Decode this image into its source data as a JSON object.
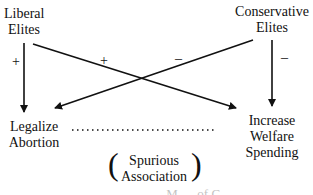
{
  "nodes": {
    "liberal_elites": [
      "Liberal",
      "Elites"
    ],
    "conservative_elites": [
      "Conservative",
      "Elites"
    ],
    "legalize_abortion": [
      "Legalize",
      "Abortion"
    ],
    "increase_welfare": [
      "Increase",
      "Welfare",
      "Spending"
    ]
  },
  "edges": [
    {
      "from": "Liberal Elites",
      "to": "Legalize Abortion",
      "sign": "+"
    },
    {
      "from": "Liberal Elites",
      "to": "Increase Welfare Spending",
      "sign": "+"
    },
    {
      "from": "Conservative Elites",
      "to": "Legalize Abortion",
      "sign": "–"
    },
    {
      "from": "Conservative Elites",
      "to": "Increase Welfare Spending",
      "sign": "–"
    }
  ],
  "spurious": {
    "line1": "Spurious",
    "line2": "Association",
    "paren_open": "(",
    "paren_close": ")"
  },
  "bleed_text": "… M … of C …"
}
